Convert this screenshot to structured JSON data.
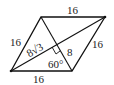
{
  "figure": {
    "type": "rhombus",
    "vertices": {
      "top_left": [
        41,
        17
      ],
      "top_right": [
        105,
        17
      ],
      "bottom_right": [
        72,
        71
      ],
      "bottom_left": [
        11,
        71
      ]
    },
    "labels": {
      "top_side": "16",
      "left_side": "16",
      "right_side": "16",
      "bottom_side": "16",
      "half_long_diagonal": "8√3",
      "half_short_diagonal": "8",
      "angle": "60°"
    },
    "colors": {
      "line": "#111111",
      "text": "#222222",
      "background": "#ffffff"
    }
  }
}
